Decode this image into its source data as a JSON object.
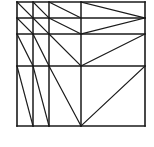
{
  "figure": {
    "kind": "line-diagram",
    "background_color": "#ffffff",
    "stroke_color": "#1a1a1a",
    "canvas": {
      "width": 154,
      "height": 147
    },
    "domain": {
      "x_min": 17,
      "x_max": 145,
      "y_min": 2,
      "y_max": 126
    },
    "grid": {
      "vertical_x": [
        17,
        33,
        49,
        81,
        145
      ],
      "horizontal_y": [
        2,
        18,
        34,
        66,
        126
      ]
    },
    "stroke_widths": {
      "border": 1.6,
      "grid": 1.5,
      "diagonal": 1.2
    },
    "segments": [
      {
        "name": "border-left",
        "x1": 17,
        "y1": 2,
        "x2": 17,
        "y2": 126,
        "w": 1.6
      },
      {
        "name": "border-right",
        "x1": 145,
        "y1": 2,
        "x2": 145,
        "y2": 126,
        "w": 1.6
      },
      {
        "name": "border-top",
        "x1": 17,
        "y1": 2,
        "x2": 145,
        "y2": 2,
        "w": 1.6
      },
      {
        "name": "border-bottom",
        "x1": 17,
        "y1": 126,
        "x2": 145,
        "y2": 126,
        "w": 1.6
      },
      {
        "name": "grid-h-18",
        "x1": 17,
        "y1": 18,
        "x2": 145,
        "y2": 18,
        "w": 1.5
      },
      {
        "name": "grid-h-34",
        "x1": 17,
        "y1": 34,
        "x2": 145,
        "y2": 34,
        "w": 1.5
      },
      {
        "name": "grid-h-66",
        "x1": 17,
        "y1": 66,
        "x2": 145,
        "y2": 66,
        "w": 1.5
      },
      {
        "name": "grid-v-33",
        "x1": 33,
        "y1": 2,
        "x2": 33,
        "y2": 126,
        "w": 1.5
      },
      {
        "name": "grid-v-49",
        "x1": 49,
        "y1": 2,
        "x2": 49,
        "y2": 126,
        "w": 1.5
      },
      {
        "name": "grid-v-81",
        "x1": 81,
        "y1": 2,
        "x2": 81,
        "y2": 126,
        "w": 1.5
      },
      {
        "name": "diag-r1c1",
        "x1": 17,
        "y1": 2,
        "x2": 33,
        "y2": 18,
        "w": 1.2
      },
      {
        "name": "diag-r1c2",
        "x1": 33,
        "y1": 2,
        "x2": 49,
        "y2": 18,
        "w": 1.2
      },
      {
        "name": "diag-r1c3",
        "x1": 49,
        "y1": 2,
        "x2": 81,
        "y2": 18,
        "w": 1.2
      },
      {
        "name": "diag-r1c4",
        "x1": 81,
        "y1": 2,
        "x2": 145,
        "y2": 18,
        "w": 1.2
      },
      {
        "name": "diag-r2c1",
        "x1": 17,
        "y1": 18,
        "x2": 33,
        "y2": 34,
        "w": 1.2
      },
      {
        "name": "diag-r2c2",
        "x1": 33,
        "y1": 18,
        "x2": 49,
        "y2": 34,
        "w": 1.2
      },
      {
        "name": "diag-r2c3",
        "x1": 49,
        "y1": 18,
        "x2": 81,
        "y2": 34,
        "w": 1.2
      },
      {
        "name": "diag-r2c4",
        "x1": 145,
        "y1": 18,
        "x2": 81,
        "y2": 34,
        "w": 1.2
      },
      {
        "name": "diag-r3c1",
        "x1": 17,
        "y1": 34,
        "x2": 33,
        "y2": 66,
        "w": 1.2
      },
      {
        "name": "diag-r3c2",
        "x1": 33,
        "y1": 34,
        "x2": 49,
        "y2": 66,
        "w": 1.2
      },
      {
        "name": "diag-r3c3",
        "x1": 49,
        "y1": 34,
        "x2": 81,
        "y2": 66,
        "w": 1.2
      },
      {
        "name": "diag-r3c4",
        "x1": 145,
        "y1": 34,
        "x2": 81,
        "y2": 66,
        "w": 1.2
      },
      {
        "name": "diag-r4c1",
        "x1": 17,
        "y1": 66,
        "x2": 33,
        "y2": 126,
        "w": 1.2
      },
      {
        "name": "diag-r4c2",
        "x1": 33,
        "y1": 66,
        "x2": 49,
        "y2": 126,
        "w": 1.2
      },
      {
        "name": "diag-r4c3",
        "x1": 49,
        "y1": 66,
        "x2": 81,
        "y2": 126,
        "w": 1.2
      },
      {
        "name": "diag-r4c4",
        "x1": 145,
        "y1": 66,
        "x2": 81,
        "y2": 126,
        "w": 1.2
      }
    ]
  }
}
